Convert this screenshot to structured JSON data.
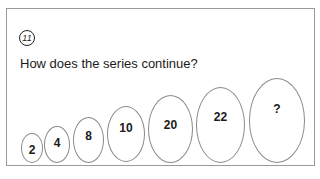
{
  "puzzle": {
    "number": "11",
    "question": "How does the series continue?",
    "series": [
      {
        "label": "2"
      },
      {
        "label": "4"
      },
      {
        "label": "8"
      },
      {
        "label": "10"
      },
      {
        "label": "20"
      },
      {
        "label": "22"
      },
      {
        "label": "?"
      }
    ]
  }
}
